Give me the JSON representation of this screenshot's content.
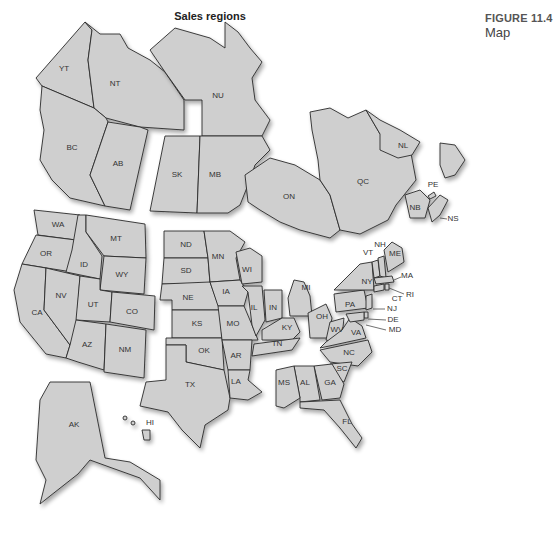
{
  "title": "Sales regions",
  "figure": {
    "number": "FIGURE 11.4",
    "caption": "Map"
  },
  "colors": {
    "fill": "#cfcfcf",
    "stroke": "#2a2a2a",
    "background": "#ffffff"
  },
  "regions": {
    "YT": "YT",
    "NT": "NT",
    "NU": "NU",
    "BC": "BC",
    "AB": "AB",
    "SK": "SK",
    "MB": "MB",
    "ON": "ON",
    "QC": "QC",
    "NL": "NL",
    "PE": "PE",
    "NB": "NB",
    "NS": "NS",
    "WA": "WA",
    "OR": "OR",
    "CA": "CA",
    "ID": "ID",
    "NV": "NV",
    "MT": "MT",
    "WY": "WY",
    "UT": "UT",
    "CO": "CO",
    "AZ": "AZ",
    "NM": "NM",
    "ND": "ND",
    "SD": "SD",
    "NE": "NE",
    "KS": "KS",
    "OK": "OK",
    "TX": "TX",
    "MN": "MN",
    "IA": "IA",
    "MO": "MO",
    "AR": "AR",
    "LA": "LA",
    "WI": "WI",
    "IL": "IL",
    "IN": "IN",
    "KY": "KY",
    "TN": "TN",
    "MI": "MI",
    "OH": "OH",
    "WV": "WV",
    "VA": "VA",
    "PA": "PA",
    "NY": "NY",
    "VT": "VT",
    "NH": "NH",
    "ME": "ME",
    "MA": "MA",
    "RI": "RI",
    "CT": "CT",
    "NJ": "NJ",
    "DE": "DE",
    "MD": "MD",
    "NC": "NC",
    "SC": "SC",
    "GA": "GA",
    "AL": "AL",
    "MS": "MS",
    "FL": "FL",
    "AK": "AK",
    "HI": "HI"
  },
  "region_groups": [
    {
      "name": "Western Canada",
      "members": [
        "YT",
        "NT",
        "BC",
        "AB"
      ]
    },
    {
      "name": "Central Canada",
      "members": [
        "NU",
        "SK",
        "MB"
      ]
    },
    {
      "name": "Eastern Canada",
      "members": [
        "ON",
        "QC",
        "NL",
        "PE",
        "NB",
        "NS"
      ]
    },
    {
      "name": "Western US",
      "members": [
        "WA",
        "OR",
        "CA",
        "ID",
        "NV",
        "MT",
        "WY",
        "UT",
        "CO",
        "AZ",
        "NM"
      ]
    },
    {
      "name": "Central US",
      "members": [
        "ND",
        "SD",
        "NE",
        "KS",
        "OK",
        "TX",
        "MN",
        "IA",
        "MO",
        "AR",
        "LA",
        "WI",
        "IL",
        "IN",
        "KY",
        "TN"
      ]
    },
    {
      "name": "Eastern US",
      "members": [
        "MI",
        "OH",
        "WV",
        "VA",
        "PA",
        "NY",
        "VT",
        "NH",
        "ME",
        "MA",
        "RI",
        "CT",
        "NJ",
        "DE",
        "MD",
        "NC",
        "SC",
        "GA",
        "AL",
        "MS",
        "FL"
      ]
    },
    {
      "name": "Alaska & Hawaii",
      "members": [
        "AK",
        "HI"
      ]
    }
  ]
}
